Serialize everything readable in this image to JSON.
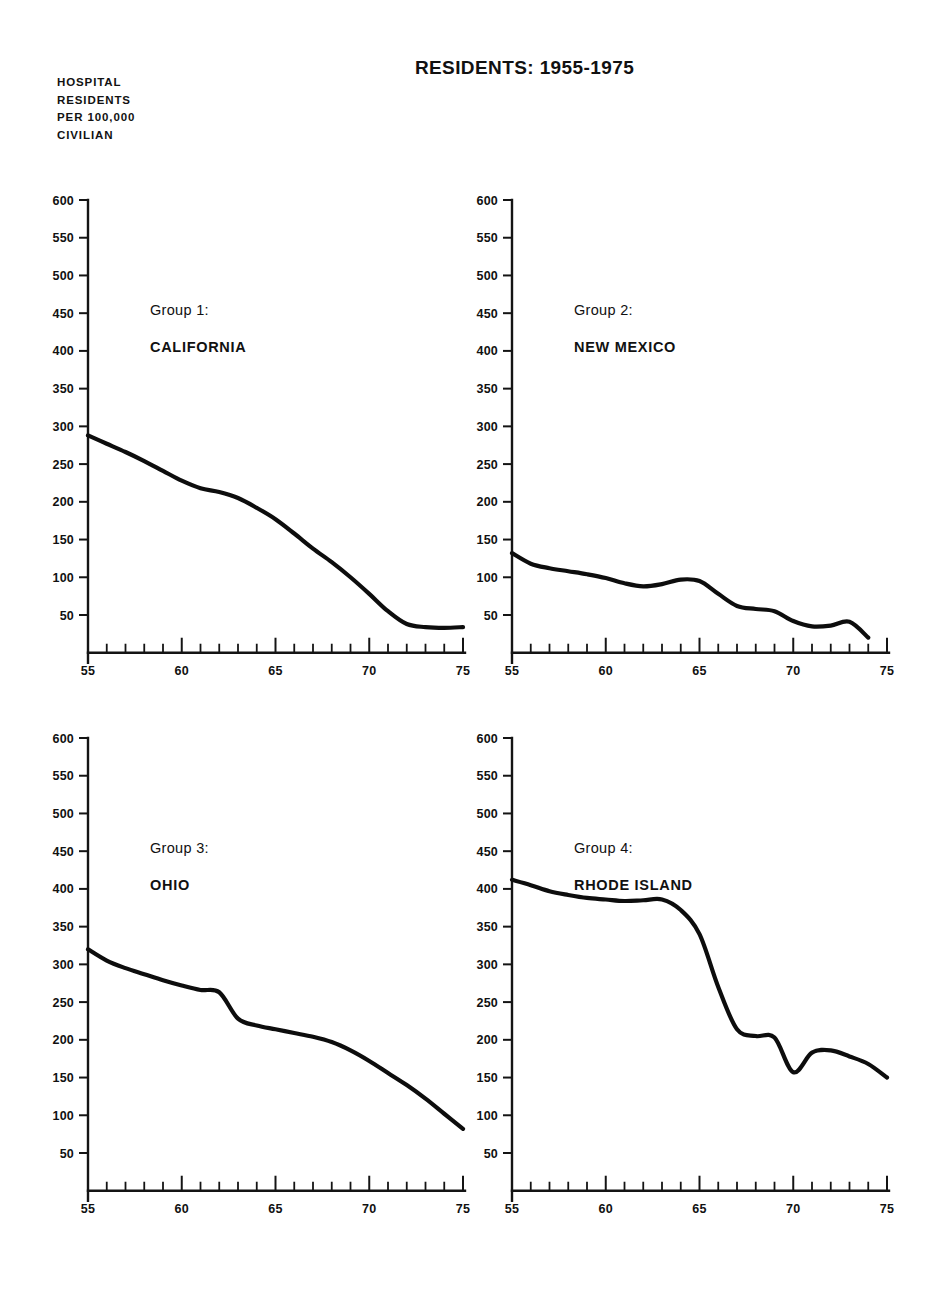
{
  "header": {
    "title": "RESIDENTS: 1955-1975",
    "y_axis_caption_lines": [
      "HOSPITAL",
      "RESIDENTS",
      "PER 100,000",
      "CIVILIAN"
    ],
    "y_axis_caption": "HOSPITAL\nRESIDENTS\nPER 100,000\nCIVILIAN"
  },
  "axes": {
    "y_ticks": [
      "600",
      "550",
      "500",
      "450",
      "400",
      "350",
      "300",
      "250",
      "200",
      "150",
      "100",
      "50"
    ],
    "x_ticks": [
      "55",
      "60",
      "65",
      "70",
      "75"
    ],
    "y_min": 0,
    "y_max": 600,
    "x_min": 55,
    "x_max": 75,
    "line_color": "#0d0d0d",
    "text_color": "#111111"
  },
  "panels": [
    {
      "group_label": "Group 1:",
      "name": "CALIFORNIA",
      "label_x": 63,
      "label_y": 31
    },
    {
      "group_label": "Group 2:",
      "name": "NEW MEXICO",
      "label_x": 63,
      "label_y": 31
    },
    {
      "group_label": "Group 3:",
      "name": "OHIO",
      "label_x": 63,
      "label_y": 31
    },
    {
      "group_label": "Group 4:",
      "name": "RHODE ISLAND",
      "label_x": 63,
      "label_y": 31
    }
  ],
  "chart_data": {
    "type": "line",
    "title": "RESIDENTS: 1955-1975",
    "xlabel": "",
    "ylabel": "HOSPITAL RESIDENTS PER 100,000 CIVILIAN",
    "xlim": [
      55,
      75
    ],
    "ylim": [
      0,
      600
    ],
    "ytick_values": [
      50,
      100,
      150,
      200,
      250,
      300,
      350,
      400,
      450,
      500,
      550,
      600
    ],
    "xtick_values": [
      55,
      60,
      65,
      70,
      75
    ],
    "xtick_minor_step": 1,
    "grid": false,
    "legend": "none",
    "panel_layout": "2x2",
    "x": [
      55,
      56,
      57,
      58,
      59,
      60,
      61,
      62,
      63,
      64,
      65,
      66,
      67,
      68,
      69,
      70,
      71,
      72,
      73,
      74,
      75
    ],
    "series": [
      {
        "name": "CALIFORNIA",
        "group": "Group 1:",
        "panel": 1,
        "x_end": 75,
        "values": [
          288,
          277,
          266,
          254,
          241,
          228,
          218,
          213,
          205,
          192,
          177,
          158,
          138,
          120,
          100,
          78,
          55,
          38,
          34,
          33,
          34
        ]
      },
      {
        "name": "NEW MEXICO",
        "group": "Group 2:",
        "panel": 2,
        "x_end": 74,
        "values": [
          132,
          118,
          112,
          108,
          104,
          99,
          92,
          88,
          91,
          97,
          95,
          78,
          62,
          58,
          55,
          42,
          35,
          36,
          41,
          20,
          null
        ]
      },
      {
        "name": "OHIO",
        "group": "Group 3:",
        "panel": 3,
        "x_end": 75,
        "values": [
          320,
          305,
          295,
          287,
          279,
          272,
          266,
          263,
          228,
          219,
          214,
          209,
          204,
          197,
          186,
          172,
          156,
          140,
          122,
          102,
          82
        ]
      },
      {
        "name": "RHODE ISLAND",
        "group": "Group 4:",
        "panel": 4,
        "x_end": 75,
        "values": [
          412,
          405,
          397,
          392,
          388,
          386,
          384,
          385,
          386,
          372,
          340,
          270,
          214,
          205,
          203,
          157,
          183,
          186,
          178,
          168,
          150
        ]
      }
    ]
  }
}
